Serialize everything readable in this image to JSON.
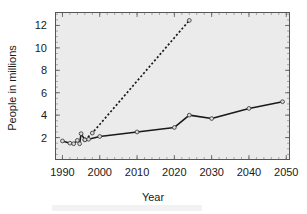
{
  "chart_data": {
    "type": "line",
    "title": "",
    "xlabel": "Year",
    "ylabel": "People in millions",
    "xlim": [
      1988,
      2051
    ],
    "ylim": [
      0,
      13.2
    ],
    "xticks": [
      1990,
      2000,
      2010,
      2020,
      2030,
      2040,
      2050
    ],
    "xticklabels": [
      "1990",
      "2000",
      "2010",
      "2020",
      "2030",
      "2040",
      "2050"
    ],
    "yticks": [
      2,
      4,
      6,
      8,
      10,
      12
    ],
    "yticklabels": [
      "2",
      "4",
      "6",
      "8",
      "10",
      "12"
    ],
    "grid": false,
    "legend": "none",
    "background": "#ebebeb",
    "series": [
      {
        "name": "observed-and-projected-solid",
        "style": "solid",
        "marker": "circle",
        "color": "#1a1a1a",
        "points": [
          {
            "x": 1990,
            "y": 1.7
          },
          {
            "x": 1992,
            "y": 1.5
          },
          {
            "x": 1993,
            "y": 1.45
          },
          {
            "x": 1994,
            "y": 1.75
          },
          {
            "x": 1994.6,
            "y": 1.45
          },
          {
            "x": 1995,
            "y": 2.35
          },
          {
            "x": 1996,
            "y": 1.8
          },
          {
            "x": 1997,
            "y": 1.85
          },
          {
            "x": 2000,
            "y": 2.1
          },
          {
            "x": 2010,
            "y": 2.5
          },
          {
            "x": 2020,
            "y": 2.9
          },
          {
            "x": 2024,
            "y": 4.0
          },
          {
            "x": 2030,
            "y": 3.7
          },
          {
            "x": 2040,
            "y": 4.6
          },
          {
            "x": 2049,
            "y": 5.2
          }
        ]
      },
      {
        "name": "high-projection-dashed",
        "style": "dashed",
        "marker": "circle",
        "color": "#1a1a1a",
        "points": [
          {
            "x": 1996,
            "y": 1.8
          },
          {
            "x": 1998,
            "y": 2.4
          },
          {
            "x": 2024,
            "y": 12.45
          }
        ]
      }
    ]
  },
  "axes": {
    "x_title": "Year",
    "y_title": "People in millions"
  }
}
